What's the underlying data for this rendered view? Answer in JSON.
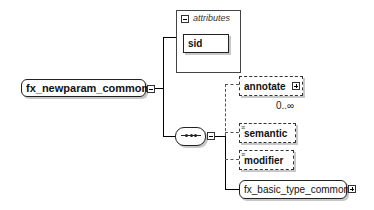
{
  "diagram": {
    "root": {
      "label": "fx_newparam_common",
      "toggle": "collapse"
    },
    "attributes": {
      "header": "attributes",
      "toggle": "collapse",
      "items": [
        {
          "label": "sid"
        }
      ]
    },
    "sequence": {
      "symbol": "•••",
      "toggle": "collapse"
    },
    "children": [
      {
        "label": "annotate",
        "optional": true,
        "toggle": "expand",
        "occurs": "0..∞"
      },
      {
        "label": "semantic",
        "optional": true,
        "doc_mark": "≡"
      },
      {
        "label": "modifier",
        "optional": true,
        "doc_mark": "≡"
      },
      {
        "label": "fx_basic_type_common",
        "optional": false,
        "type": "group",
        "toggle": "expand"
      }
    ]
  }
}
